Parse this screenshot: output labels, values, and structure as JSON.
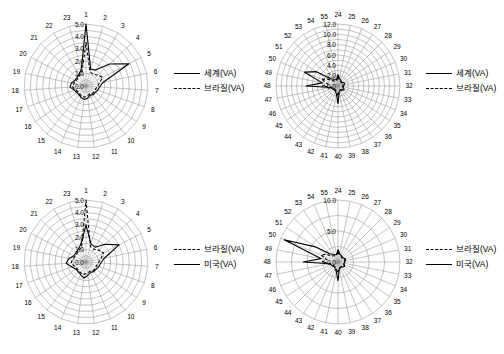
{
  "figure": {
    "panel_count": 4,
    "background": "#ffffff",
    "line_color": "#000000",
    "grid_color": "#8a8a8a"
  },
  "panels": [
    {
      "id": "top-left",
      "legend": [
        {
          "label": "세계(VA)",
          "style": "solid"
        },
        {
          "label": "브라질(VA)",
          "style": "dashed"
        }
      ],
      "chart_data": {
        "type": "line",
        "subtype": "radar",
        "title": "",
        "xlabel": "",
        "ylabel": "",
        "categories": [
          "1",
          "2",
          "3",
          "4",
          "5",
          "6",
          "7",
          "8",
          "9",
          "10",
          "11",
          "12",
          "13",
          "14",
          "15",
          "16",
          "17",
          "18",
          "19",
          "20",
          "21",
          "22",
          "23"
        ],
        "tick_labels": [
          "0.0",
          "1.0",
          "2.0",
          "3.0",
          "4.0",
          "5.0"
        ],
        "rlim": [
          0.0,
          5.0
        ],
        "grid": true,
        "legend_position": "right",
        "series": [
          {
            "name": "세계(VA)",
            "style": "solid",
            "values": [
              5.0,
              1.4,
              1.5,
              2.6,
              3.9,
              1.4,
              1.1,
              1.0,
              0.9,
              0.9,
              0.8,
              1.0,
              1.1,
              1.0,
              0.9,
              0.9,
              1.0,
              1.3,
              1.2,
              1.0,
              1.0,
              1.1,
              1.4
            ]
          },
          {
            "name": "브라질(VA)",
            "style": "dashed",
            "values": [
              3.5,
              1.2,
              1.1,
              1.3,
              1.5,
              1.1,
              0.9,
              0.8,
              0.8,
              0.8,
              0.7,
              0.8,
              0.9,
              0.9,
              0.8,
              0.8,
              0.9,
              1.1,
              1.0,
              0.9,
              0.9,
              1.0,
              1.2
            ]
          }
        ]
      }
    },
    {
      "id": "top-right",
      "legend": [
        {
          "label": "세계(VA)",
          "style": "solid"
        },
        {
          "label": "브라질(VA)",
          "style": "dashed"
        }
      ],
      "chart_data": {
        "type": "line",
        "subtype": "radar",
        "title": "",
        "xlabel": "",
        "ylabel": "",
        "categories": [
          "24",
          "25",
          "26",
          "27",
          "28",
          "29",
          "30",
          "31",
          "32",
          "33",
          "34",
          "35",
          "36",
          "37",
          "38",
          "39",
          "40",
          "41",
          "42",
          "43",
          "44",
          "45",
          "46",
          "47",
          "48",
          "49",
          "50",
          "51",
          "52",
          "53",
          "54",
          "55"
        ],
        "tick_labels": [
          "0.0",
          "2.0",
          "4.0",
          "6.0",
          "8.0",
          "10.0",
          "12.0"
        ],
        "rlim": [
          0.0,
          12.0
        ],
        "grid": true,
        "legend_position": "right",
        "series": [
          {
            "name": "세계(VA)",
            "style": "solid",
            "values": [
              2.2,
              1.5,
              1.3,
              1.1,
              1.0,
              1.2,
              1.4,
              1.2,
              1.1,
              1.0,
              1.2,
              1.4,
              1.1,
              1.0,
              1.0,
              1.2,
              3.4,
              1.6,
              1.2,
              1.1,
              1.0,
              1.1,
              1.3,
              1.5,
              6.2,
              3.1,
              7.0,
              5.0,
              2.0,
              1.6,
              1.4,
              1.3
            ]
          },
          {
            "name": "브라질(VA)",
            "style": "dashed",
            "values": [
              1.8,
              1.2,
              1.1,
              1.0,
              0.9,
              1.0,
              1.1,
              1.0,
              0.9,
              0.9,
              1.0,
              1.1,
              1.0,
              0.9,
              0.9,
              1.0,
              2.0,
              1.2,
              1.0,
              0.9,
              0.9,
              1.0,
              1.1,
              1.2,
              3.0,
              2.0,
              3.5,
              2.4,
              1.4,
              1.2,
              1.1,
              1.1
            ]
          }
        ]
      }
    },
    {
      "id": "bottom-left",
      "legend": [
        {
          "label": "브라질(VA)",
          "style": "dashed"
        },
        {
          "label": "미국(VA)",
          "style": "solid"
        }
      ],
      "chart_data": {
        "type": "line",
        "subtype": "radar",
        "title": "",
        "xlabel": "",
        "ylabel": "",
        "categories": [
          "1",
          "2",
          "3",
          "4",
          "5",
          "6",
          "7",
          "8",
          "9",
          "10",
          "11",
          "12",
          "13",
          "14",
          "15",
          "16",
          "17",
          "18",
          "19",
          "20",
          "21",
          "22",
          "23"
        ],
        "tick_labels": [
          "0.0",
          "1.0",
          "2.0",
          "3.0",
          "4.0",
          "5.0"
        ],
        "rlim": [
          0.0,
          5.0
        ],
        "grid": true,
        "legend_position": "right",
        "series": [
          {
            "name": "브라질(VA)",
            "style": "dashed",
            "values": [
              5.0,
              1.3,
              1.2,
              1.4,
              1.6,
              1.2,
              1.0,
              0.9,
              0.9,
              0.9,
              0.8,
              0.9,
              1.0,
              1.0,
              0.9,
              0.9,
              1.0,
              1.2,
              1.1,
              1.0,
              1.0,
              1.1,
              1.3
            ]
          },
          {
            "name": "미국(VA)",
            "style": "solid",
            "values": [
              3.0,
              1.5,
              1.4,
              2.1,
              3.0,
              1.5,
              1.2,
              1.1,
              1.0,
              1.0,
              0.9,
              1.1,
              1.3,
              1.1,
              1.0,
              1.0,
              1.2,
              1.6,
              1.4,
              1.1,
              1.1,
              1.2,
              1.5
            ]
          }
        ]
      }
    },
    {
      "id": "bottom-right",
      "legend": [
        {
          "label": "브라질(VA)",
          "style": "dashed"
        },
        {
          "label": "미국(VA)",
          "style": "solid"
        }
      ],
      "chart_data": {
        "type": "line",
        "subtype": "radar",
        "title": "",
        "xlabel": "",
        "ylabel": "",
        "categories": [
          "24",
          "25",
          "26",
          "27",
          "28",
          "29",
          "30",
          "31",
          "32",
          "33",
          "34",
          "35",
          "36",
          "37",
          "38",
          "39",
          "40",
          "41",
          "42",
          "43",
          "44",
          "45",
          "46",
          "47",
          "48",
          "49",
          "50",
          "51",
          "52",
          "53",
          "54",
          "55"
        ],
        "tick_labels": [
          "0.0",
          "5.0",
          "10.0"
        ],
        "rlim": [
          0.0,
          10.0
        ],
        "grid": true,
        "legend_position": "right",
        "series": [
          {
            "name": "브라질(VA)",
            "style": "dashed",
            "values": [
              1.6,
              1.2,
              1.1,
              1.0,
              0.9,
              1.0,
              1.2,
              1.1,
              1.0,
              0.9,
              1.0,
              1.2,
              1.0,
              0.9,
              0.9,
              1.0,
              1.8,
              1.2,
              1.0,
              0.9,
              0.9,
              1.0,
              1.1,
              1.3,
              2.6,
              1.8,
              3.0,
              2.2,
              1.4,
              1.2,
              1.1,
              1.1
            ]
          },
          {
            "name": "미국(VA)",
            "style": "solid",
            "values": [
              2.0,
              1.4,
              1.2,
              1.1,
              1.0,
              1.1,
              1.3,
              1.2,
              1.1,
              1.0,
              1.1,
              1.3,
              1.1,
              1.0,
              1.0,
              1.1,
              3.0,
              1.5,
              1.2,
              1.0,
              1.0,
              1.1,
              1.2,
              1.4,
              5.6,
              2.8,
              9.4,
              4.4,
              1.9,
              1.5,
              1.3,
              1.2
            ]
          }
        ]
      }
    }
  ]
}
